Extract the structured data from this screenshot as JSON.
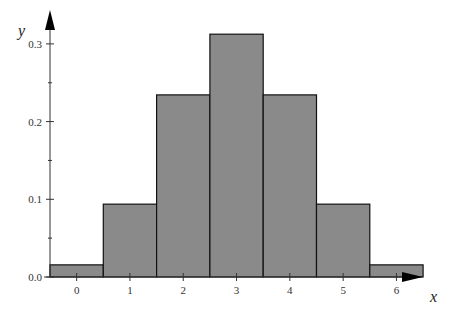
{
  "chart_data": {
    "type": "bar",
    "title": "",
    "xlabel": "x",
    "ylabel": "y",
    "categories": [
      "0",
      "1",
      "2",
      "3",
      "4",
      "5",
      "6"
    ],
    "values": [
      0.015625,
      0.09375,
      0.234375,
      0.3125,
      0.234375,
      0.09375,
      0.015625
    ],
    "ylim": [
      0,
      0.34
    ],
    "yticks": [
      "0.0",
      "0.1",
      "0.2",
      "0.3"
    ],
    "ytick_values": [
      0,
      0.1,
      0.2,
      0.3
    ],
    "yminor_ticks": [
      0.05,
      0.15,
      0.25
    ],
    "xticks": [
      "0",
      "1",
      "2",
      "3",
      "4",
      "5",
      "6"
    ],
    "grid": false,
    "bar_color": "#8a8a8a",
    "edge_color": "#111111"
  }
}
